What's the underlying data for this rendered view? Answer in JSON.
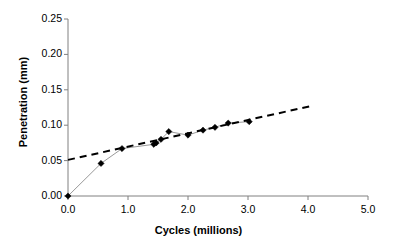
{
  "chart_data": {
    "type": "line",
    "title": "",
    "xlabel": "Cycles (millions)",
    "ylabel": "Penetration (mm)",
    "xlim": [
      0.0,
      5.0
    ],
    "ylim": [
      0.0,
      0.25
    ],
    "grid": false,
    "legend": "none",
    "x_ticks": [
      "0.0",
      "1.0",
      "2.0",
      "3.0",
      "4.0",
      "5.0"
    ],
    "x_tick_values": [
      0.0,
      1.0,
      2.0,
      3.0,
      4.0,
      5.0
    ],
    "y_ticks": [
      "0.00",
      "0.05",
      "0.10",
      "0.15",
      "0.20",
      "0.25"
    ],
    "y_tick_values": [
      0.0,
      0.05,
      0.1,
      0.15,
      0.2,
      0.25
    ],
    "series": [
      {
        "name": "Measured penetration",
        "style": "thin solid gray line with black diamond markers",
        "marker": "diamond",
        "marker_color": "#000000",
        "line_color": "#999999",
        "x": [
          0.0,
          0.55,
          0.9,
          1.43,
          1.47,
          1.55,
          1.68,
          2.0,
          2.25,
          2.45,
          2.67,
          3.02
        ],
        "y": [
          0.0,
          0.046,
          0.067,
          0.073,
          0.075,
          0.08,
          0.091,
          0.086,
          0.093,
          0.097,
          0.103,
          0.105
        ]
      },
      {
        "name": "Linear trendline",
        "style": "black dashed line",
        "marker": "none",
        "line_color": "#000000",
        "dash": true,
        "x": [
          0.0,
          4.1
        ],
        "y": [
          0.051,
          0.128
        ]
      }
    ],
    "annotations": []
  },
  "axes": {
    "x_title": "Cycles (millions)",
    "y_title": "Penetration (mm)"
  },
  "colors": {
    "axis": "#808080",
    "marker": "#000000",
    "data_line": "#999999",
    "trend_line": "#000000",
    "background": "#ffffff",
    "text": "#000000"
  }
}
